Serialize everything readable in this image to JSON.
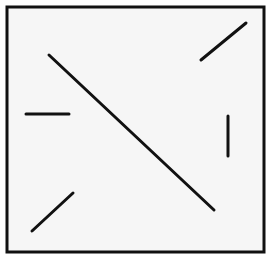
{
  "figure": {
    "width": 273,
    "height": 266,
    "background": "#ffffff",
    "frame": {
      "x": 7,
      "y": 7,
      "width": 257,
      "height": 245,
      "fill": "#f6f6f6",
      "stroke": "#111111",
      "stroke_width": 3
    },
    "line_color": "#111111",
    "line_width": 3,
    "segments": [
      {
        "name": "long-diagonal-line",
        "x1": 49,
        "y1": 55,
        "x2": 214,
        "y2": 210
      },
      {
        "name": "top-right-diagonal-line",
        "x1": 201,
        "y1": 60,
        "x2": 246,
        "y2": 23
      },
      {
        "name": "left-horizontal-line",
        "x1": 26,
        "y1": 114,
        "x2": 69,
        "y2": 114
      },
      {
        "name": "right-vertical-line",
        "x1": 228,
        "y1": 116,
        "x2": 228,
        "y2": 156
      },
      {
        "name": "bottom-left-diagonal-line",
        "x1": 32,
        "y1": 231,
        "x2": 73,
        "y2": 193
      }
    ]
  }
}
